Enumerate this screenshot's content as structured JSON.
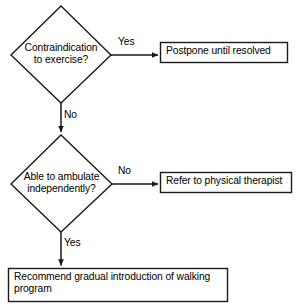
{
  "diagram": {
    "type": "flowchart",
    "background_color": "#ffffff",
    "line_color": "#1a1a1a",
    "text_color": "#000000",
    "nodes": [
      {
        "id": "contraindication",
        "shape": "diamond",
        "text": "Contraindication\nto exercise?"
      },
      {
        "id": "postpone",
        "shape": "rectangle",
        "text": "Postpone until resolved"
      },
      {
        "id": "ambulate",
        "shape": "diamond",
        "text": "Able to ambulate\nindependently?"
      },
      {
        "id": "refer",
        "shape": "rectangle",
        "text": "Refer to physical therapist"
      },
      {
        "id": "recommend",
        "shape": "rectangle",
        "text": "Recommend gradual introduction of walking\nprogram"
      }
    ],
    "edges": [
      {
        "id": "e1",
        "from": "contraindication",
        "to": "postpone",
        "label": "Yes",
        "direction": "right"
      },
      {
        "id": "e2",
        "from": "contraindication",
        "to": "ambulate",
        "label": "No",
        "direction": "down"
      },
      {
        "id": "e3",
        "from": "ambulate",
        "to": "refer",
        "label": "No",
        "direction": "right"
      },
      {
        "id": "e4",
        "from": "ambulate",
        "to": "recommend",
        "label": "Yes",
        "direction": "down"
      }
    ]
  }
}
